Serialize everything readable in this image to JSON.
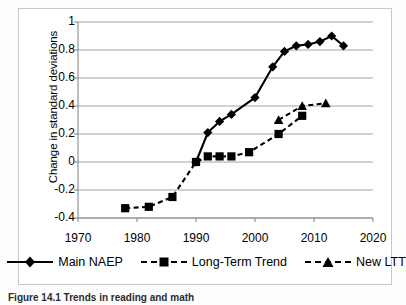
{
  "figure": {
    "caption": "Figure 14.1  Trends in reading and math",
    "legend_position": "bottom-center"
  },
  "axes": {
    "y_title": "Change in standard deviations",
    "y_ticks": [
      "1",
      "0.8",
      "0.6",
      "0.4",
      "0.2",
      "0",
      "-0.2",
      "-0.4"
    ],
    "x_ticks": [
      "1970",
      "1980",
      "1990",
      "2000",
      "2010",
      "2020"
    ]
  },
  "legend": {
    "items": [
      {
        "label": "Main NAEP",
        "marker": "diamond",
        "line": "solid",
        "color": "#000000"
      },
      {
        "label": "Long-Term Trend",
        "marker": "square",
        "line": "dashed",
        "color": "#000000"
      },
      {
        "label": "New LTT",
        "marker": "triangle",
        "line": "dashed",
        "color": "#000000"
      }
    ]
  },
  "chart_data": {
    "type": "line",
    "title": "",
    "xlabel": "",
    "ylabel": "Change in standard deviations",
    "xlim": [
      1970,
      2020
    ],
    "ylim": [
      -0.4,
      1.0
    ],
    "grid": true,
    "legend": "bottom",
    "series": [
      {
        "name": "Main NAEP",
        "marker": "diamond",
        "line": "solid",
        "x": [
          1990,
          1992,
          1994,
          1996,
          2000,
          2003,
          2005,
          2007,
          2009,
          2011,
          2013,
          2015
        ],
        "y": [
          0.0,
          0.21,
          0.29,
          0.34,
          0.46,
          0.68,
          0.79,
          0.83,
          0.84,
          0.86,
          0.9,
          0.83
        ]
      },
      {
        "name": "Long-Term Trend",
        "marker": "square",
        "line": "dashed",
        "x": [
          1978,
          1982,
          1986,
          1990,
          1992,
          1994,
          1996,
          1999,
          2004,
          2008
        ],
        "y": [
          -0.33,
          -0.32,
          -0.25,
          0.0,
          0.04,
          0.04,
          0.04,
          0.07,
          0.2,
          0.33
        ]
      },
      {
        "name": "New LTT",
        "marker": "triangle",
        "line": "dashed",
        "x": [
          2004,
          2008,
          2012
        ],
        "y": [
          0.3,
          0.4,
          0.42
        ]
      }
    ]
  }
}
